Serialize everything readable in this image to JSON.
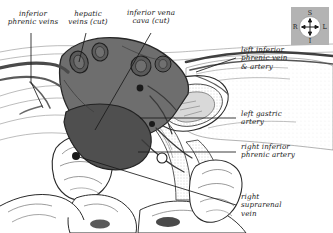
{
  "figure": {
    "background_color": "#ffffff",
    "ink_color": "#1a1a1a",
    "vessel_fill_color": "#6e6e6e",
    "vessel_dark_color": "#4f4f4f"
  },
  "labels": {
    "inferior_phrenic_veins": "inferior\nphrenic veins",
    "hepatic_veins_cut": "hepatic\nveins (cut)",
    "inferior_vena_cava_cut": "inferior vena\ncava (cut)",
    "left_inferior_phrenic_vein_artery": "left inferior\nphrenic vein\n& artery",
    "left_gastric_artery": "left gastric\nartery",
    "right_inferior_phrenic_artery": "right inferior\nphrenic artery",
    "right_suprarenal_vein": "right\nsuprarenal\nvein"
  },
  "compass": {
    "superior": "S",
    "inferior": "I",
    "right": "R",
    "left": "L",
    "background_color": "#b3b3b3",
    "dial_color": "#ffffff"
  }
}
